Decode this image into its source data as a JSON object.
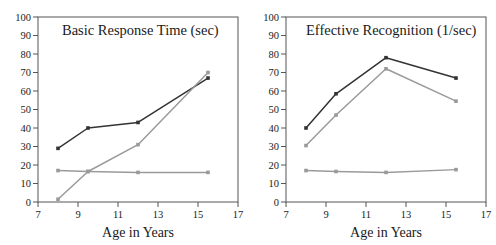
{
  "figure": {
    "background": "#ffffff",
    "panel_count": 2
  },
  "chart_data": [
    {
      "type": "line",
      "title": "Basic Response Time (sec)",
      "xlabel": "Age in Years",
      "ylabel": "",
      "xlim": [
        7,
        17
      ],
      "ylim": [
        0,
        100
      ],
      "xticks": [
        7,
        9,
        11,
        13,
        15,
        17
      ],
      "yticks": [
        0,
        10,
        20,
        30,
        40,
        50,
        60,
        70,
        80,
        90,
        100
      ],
      "grid": false,
      "legend": "none",
      "x": [
        8,
        9.5,
        12,
        15.5
      ],
      "series": [
        {
          "name": "dark-series",
          "color": "#333333",
          "values": [
            29,
            40,
            43,
            67
          ]
        },
        {
          "name": "gray-rising-series",
          "color": "#9a9a9a",
          "values": [
            1.5,
            16.5,
            31,
            70
          ]
        },
        {
          "name": "gray-flat-series",
          "color": "#9a9a9a",
          "values": [
            17,
            16.5,
            16,
            16
          ]
        }
      ]
    },
    {
      "type": "line",
      "title": "Effective Recognition (1/sec)",
      "xlabel": "Age in Years",
      "ylabel": "",
      "xlim": [
        7,
        17
      ],
      "ylim": [
        0,
        100
      ],
      "xticks": [
        7,
        9,
        11,
        13,
        15,
        17
      ],
      "yticks": [
        0,
        10,
        20,
        30,
        40,
        50,
        60,
        70,
        80,
        90,
        100
      ],
      "grid": false,
      "legend": "none",
      "x": [
        8,
        9.5,
        12,
        15.5
      ],
      "series": [
        {
          "name": "dark-series",
          "color": "#333333",
          "values": [
            40,
            58.5,
            78,
            67
          ]
        },
        {
          "name": "gray-peak-series",
          "color": "#9a9a9a",
          "values": [
            30.5,
            47,
            72,
            54.5
          ]
        },
        {
          "name": "gray-flat-series",
          "color": "#9a9a9a",
          "values": [
            17,
            16.5,
            16,
            17.5
          ]
        }
      ]
    }
  ]
}
